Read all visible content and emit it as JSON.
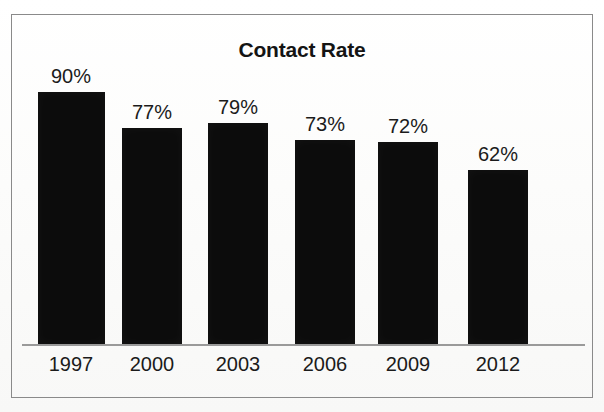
{
  "chart_data": {
    "type": "bar",
    "title": "Contact Rate",
    "xlabel": "",
    "ylabel": "",
    "categories": [
      "1997",
      "2000",
      "2003",
      "2006",
      "2009",
      "2012"
    ],
    "values": [
      90,
      77,
      79,
      73,
      72,
      62
    ],
    "value_labels": [
      "90%",
      "77%",
      "79%",
      "73%",
      "72%",
      "62%"
    ],
    "unit": "%",
    "ylim": [
      0,
      100
    ],
    "grid": false,
    "legend": null,
    "series": [
      {
        "name": "Contact Rate",
        "values": [
          90,
          77,
          79,
          73,
          72,
          62
        ],
        "color": "#0c0c0c"
      }
    ],
    "colors": {
      "bar": "#0c0c0c",
      "axis": "#9a9a9a",
      "frame": "#8a8a8a",
      "text": "#1b1b1b",
      "background": "#fdfdfd"
    }
  }
}
